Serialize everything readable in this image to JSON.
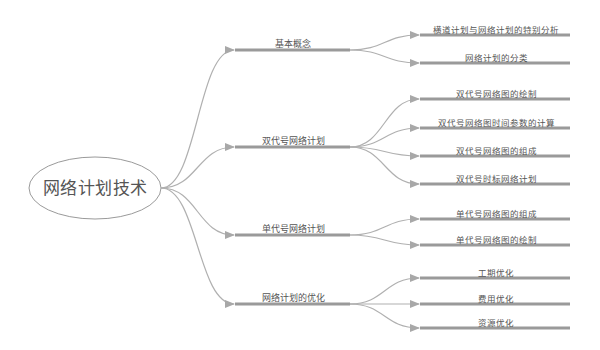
{
  "mindmap": {
    "root": {
      "label": "网络计划技术"
    },
    "branches": [
      {
        "label": "基本概念",
        "y": 50,
        "children": [
          {
            "label": "横道计划与网络计划的特别分析",
            "y": 35
          },
          {
            "label": "网络计划的分类",
            "y": 63
          }
        ]
      },
      {
        "label": "双代号网络计划",
        "y": 147,
        "children": [
          {
            "label": "双代号网络图的绘制",
            "y": 99
          },
          {
            "label": "双代号网络图时间参数的计算",
            "y": 128
          },
          {
            "label": "双代号网络图的组成",
            "y": 156
          },
          {
            "label": "双代号时标网络计划",
            "y": 184
          }
        ]
      },
      {
        "label": "单代号网络计划",
        "y": 235,
        "children": [
          {
            "label": "单代号网络图的组成",
            "y": 219
          },
          {
            "label": "单代号网络图的绘制",
            "y": 245
          }
        ]
      },
      {
        "label": "网络计划的优化",
        "y": 304,
        "children": [
          {
            "label": "工期优化",
            "y": 278
          },
          {
            "label": "费用优化",
            "y": 304
          },
          {
            "label": "资源优化",
            "y": 328
          }
        ]
      }
    ]
  },
  "colors": {
    "line": "#9a9a9a",
    "connector": "#b0b0b0",
    "text": "#555555",
    "background": "#ffffff"
  }
}
